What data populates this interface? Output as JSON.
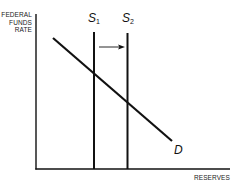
{
  "diagram": {
    "type": "supply-demand",
    "y_axis_label": [
      "FEDERAL",
      "FUNDS",
      "RATE"
    ],
    "x_axis_label": "RESERVES",
    "curves": [
      {
        "id": "S1",
        "letter": "S",
        "subscript": "1",
        "kind": "vertical supply"
      },
      {
        "id": "S2",
        "letter": "S",
        "subscript": "2",
        "kind": "vertical supply"
      },
      {
        "id": "D",
        "letter": "D",
        "kind": "downward-sloping demand"
      }
    ],
    "annotation": {
      "arrow": "S1 to S2 (rightward shift)"
    },
    "colors": {
      "line": "#111111",
      "background": "#ffffff"
    }
  }
}
